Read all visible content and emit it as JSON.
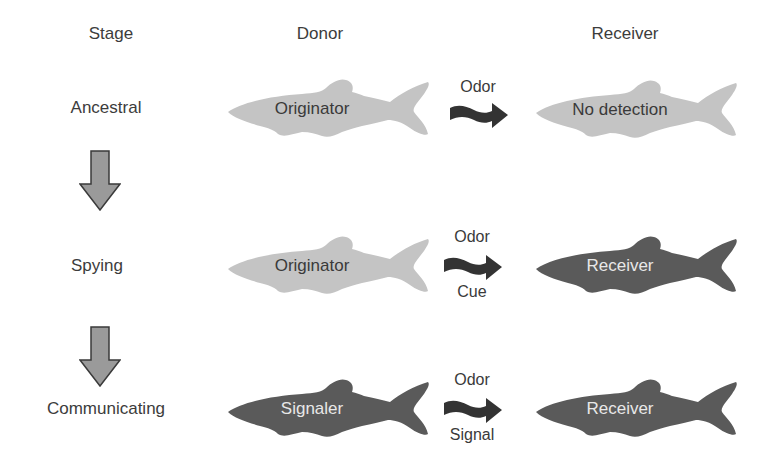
{
  "headers": {
    "stage": "Stage",
    "donor": "Donor",
    "receiver": "Receiver"
  },
  "colors": {
    "light_fish": "#c4c4c4",
    "dark_fish": "#5a5a5a",
    "arrow_dark": "#3a3a3a",
    "down_arrow_fill": "#9a9a9a",
    "down_arrow_stroke": "#3a3a3a"
  },
  "rows": [
    {
      "stage": "Ancestral",
      "donor": {
        "label": "Originator",
        "shade": "light"
      },
      "flow": {
        "above": "Odor",
        "below": ""
      },
      "receiver": {
        "label": "No detection",
        "shade": "light"
      }
    },
    {
      "stage": "Spying",
      "donor": {
        "label": "Originator",
        "shade": "light"
      },
      "flow": {
        "above": "Odor",
        "below": "Cue"
      },
      "receiver": {
        "label": "Receiver",
        "shade": "dark"
      }
    },
    {
      "stage": "Communicating",
      "donor": {
        "label": "Signaler",
        "shade": "dark"
      },
      "flow": {
        "above": "Odor",
        "below": "Signal"
      },
      "receiver": {
        "label": "Receiver",
        "shade": "dark"
      }
    }
  ],
  "icons": {
    "transition_arrow": "down-arrow-icon",
    "odor_arrow": "wavy-right-arrow-icon",
    "fish": "fish-silhouette-icon"
  }
}
